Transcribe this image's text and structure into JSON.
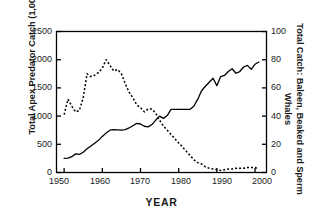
{
  "chart_data": {
    "type": "line",
    "title": "",
    "xlabel": "YEAR",
    "ylabel": "Total Apex Predator Catch (1,000 t yr-1)",
    "ylabel_right": "Total Catch: Baleen, Beaked and Sperm Whales",
    "xlim": [
      1948,
      2003
    ],
    "ylim": [
      0,
      2500
    ],
    "ylim_right": [
      0,
      100
    ],
    "xticks": [
      1950,
      1960,
      1970,
      1980,
      1990,
      2000
    ],
    "yticks_left": [
      0,
      500,
      1000,
      1500,
      2000,
      2500
    ],
    "yticks_right": [
      0,
      20,
      40,
      60,
      80,
      100
    ],
    "grid": false,
    "legend": "none",
    "series": [
      {
        "name": "Total Apex Predator Catch (1,000 t yr-1)",
        "axis": "left",
        "style": "solid",
        "color": "#000000",
        "x": [
          1950,
          1951,
          1952,
          1953,
          1954,
          1955,
          1956,
          1957,
          1958,
          1959,
          1960,
          1961,
          1962,
          1963,
          1964,
          1965,
          1966,
          1967,
          1968,
          1969,
          1970,
          1971,
          1972,
          1973,
          1974,
          1975,
          1976,
          1977,
          1978,
          1979,
          1980,
          1981,
          1982,
          1983,
          1984,
          1985,
          1986,
          1987,
          1988,
          1989,
          1990,
          1991,
          1992,
          1993,
          1994,
          1995,
          1996,
          1997,
          1998,
          1999,
          2000,
          2001
        ],
        "values": [
          250,
          255,
          280,
          330,
          320,
          360,
          420,
          470,
          520,
          570,
          640,
          700,
          750,
          760,
          755,
          750,
          760,
          790,
          830,
          870,
          860,
          820,
          810,
          850,
          930,
          1000,
          960,
          1010,
          1120,
          1120,
          1120,
          1120,
          1120,
          1120,
          1180,
          1300,
          1450,
          1530,
          1600,
          1670,
          1540,
          1700,
          1720,
          1790,
          1840,
          1760,
          1790,
          1870,
          1900,
          1830,
          1920,
          1960
        ]
      },
      {
        "name": "Total Catch: Baleen, Beaked and Sperm Whales",
        "axis": "right",
        "style": "dashed",
        "color": "#000000",
        "x": [
          1950,
          1951,
          1952,
          1953,
          1954,
          1955,
          1956,
          1957,
          1958,
          1959,
          1960,
          1961,
          1962,
          1963,
          1964,
          1965,
          1966,
          1967,
          1968,
          1969,
          1970,
          1971,
          1972,
          1973,
          1974,
          1975,
          1976,
          1977,
          1978,
          1979,
          1980,
          1981,
          1982,
          1983,
          1984,
          1985,
          1986,
          1987,
          1988,
          1989,
          1990,
          1991,
          1992,
          1993,
          1994,
          1995,
          1996,
          1997,
          1998,
          1999,
          2000,
          2001
        ],
        "values": [
          41,
          52,
          47,
          43,
          44,
          53,
          70,
          68,
          69,
          71,
          74,
          80,
          76,
          72,
          73,
          70,
          63,
          57,
          53,
          48,
          46,
          43,
          45,
          45,
          42,
          37,
          33,
          30,
          27,
          24,
          21,
          18,
          15,
          12,
          9,
          7,
          6,
          4,
          3,
          2.5,
          2,
          1.5,
          2,
          2.5,
          2.5,
          3,
          3,
          3,
          3.5,
          3.5,
          3.5,
          2.5
        ]
      }
    ]
  },
  "axis_labels": {
    "left_title_main": "Total Apex Predator Catch (1,000 t yr",
    "left_title_exp": "-1",
    "left_title_close": ")",
    "right_title": "Total Catch: Baleen, Beaked and Sperm Whales",
    "x_title": "YEAR",
    "left_ticks": [
      "2500",
      "2000",
      "1500",
      "1000",
      "500",
      "0"
    ],
    "right_ticks": [
      "100",
      "80",
      "60",
      "40",
      "20",
      "0"
    ],
    "x_ticks": [
      "1950",
      "1960",
      "1970",
      "1980",
      "1990",
      "2000"
    ]
  },
  "style": {
    "frame_color": "#000000",
    "background": "#ffffff",
    "line_color": "#000000"
  }
}
